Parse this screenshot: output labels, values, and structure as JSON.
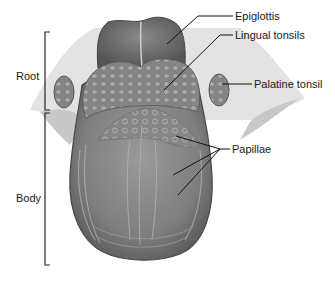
{
  "diagram": {
    "labels": {
      "epiglottis": "Epiglottis",
      "lingual_tonsils": "Lingual tonsils",
      "palatine_tonsil": "Palatine tonsil",
      "papillae": "Papillae",
      "root": "Root",
      "body": "Body"
    },
    "colors": {
      "tongue_fill": "#8c8c8c",
      "tongue_dark": "#5e5e5e",
      "epiglottis_fill": "#6f6f6f",
      "tonsil_fill": "#9a9a9a",
      "tissue_light": "#d4d4d4",
      "leader_line": "#111111",
      "text": "#1a1a1a"
    }
  }
}
